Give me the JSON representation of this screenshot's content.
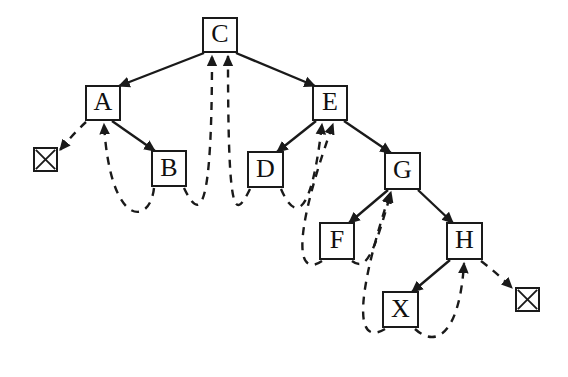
{
  "diagram": {
    "type": "threaded-binary-tree",
    "title": "",
    "colors": {
      "stroke": "#1a1a1a",
      "background": "#ffffff",
      "text": "#101010"
    },
    "legend": {
      "solid_edge_meaning": "child pointer",
      "dashed_edge_meaning": "thread pointer"
    },
    "nodes": [
      {
        "id": "C",
        "label": "C",
        "x": 202,
        "y": 17,
        "w": 36,
        "h": 36,
        "font_size": 26
      },
      {
        "id": "A",
        "label": "A",
        "x": 85,
        "y": 85,
        "w": 36,
        "h": 36,
        "font_size": 26
      },
      {
        "id": "E",
        "label": "E",
        "x": 312,
        "y": 85,
        "w": 36,
        "h": 36,
        "font_size": 26
      },
      {
        "id": "B",
        "label": "B",
        "x": 151,
        "y": 150,
        "w": 36,
        "h": 37,
        "font_size": 26
      },
      {
        "id": "D",
        "label": "D",
        "x": 247,
        "y": 151,
        "w": 37,
        "h": 37,
        "font_size": 26
      },
      {
        "id": "G",
        "label": "G",
        "x": 384,
        "y": 152,
        "w": 37,
        "h": 38,
        "font_size": 26
      },
      {
        "id": "F",
        "label": "F",
        "x": 319,
        "y": 222,
        "w": 36,
        "h": 38,
        "font_size": 26
      },
      {
        "id": "H",
        "label": "H",
        "x": 446,
        "y": 222,
        "w": 37,
        "h": 38,
        "font_size": 26
      },
      {
        "id": "X",
        "label": "X",
        "x": 382,
        "y": 291,
        "w": 37,
        "h": 37,
        "font_size": 26
      }
    ],
    "null_markers": [
      {
        "id": "null-left",
        "x": 33,
        "y": 147,
        "w": 25,
        "h": 25
      },
      {
        "id": "null-right",
        "x": 515,
        "y": 287,
        "w": 25,
        "h": 25
      }
    ],
    "child_edges": [
      {
        "from": "C",
        "to": "A",
        "side": "left"
      },
      {
        "from": "C",
        "to": "E",
        "side": "right"
      },
      {
        "from": "A",
        "to": "B",
        "side": "right"
      },
      {
        "from": "E",
        "to": "D",
        "side": "left"
      },
      {
        "from": "E",
        "to": "G",
        "side": "right"
      },
      {
        "from": "G",
        "to": "F",
        "side": "left"
      },
      {
        "from": "G",
        "to": "H",
        "side": "right"
      },
      {
        "from": "H",
        "to": "X",
        "side": "left"
      }
    ],
    "thread_edges": [
      {
        "from": "A",
        "to": "null-left",
        "kind": "predecessor-thread"
      },
      {
        "from": "B",
        "to": "A",
        "kind": "predecessor-thread"
      },
      {
        "from": "B",
        "to": "C",
        "kind": "successor-thread"
      },
      {
        "from": "D",
        "to": "C",
        "kind": "predecessor-thread"
      },
      {
        "from": "D",
        "to": "E",
        "kind": "successor-thread"
      },
      {
        "from": "F",
        "to": "E",
        "kind": "predecessor-thread"
      },
      {
        "from": "F",
        "to": "G",
        "kind": "successor-thread"
      },
      {
        "from": "X",
        "to": "G",
        "kind": "predecessor-thread"
      },
      {
        "from": "X",
        "to": "H",
        "kind": "successor-thread"
      },
      {
        "from": "H",
        "to": "null-right",
        "kind": "successor-thread"
      }
    ]
  }
}
